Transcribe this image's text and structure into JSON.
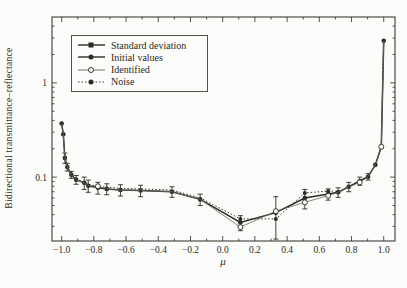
{
  "figure": {
    "background": "#fbfbf9",
    "ink": "#2d2a25"
  },
  "axes": {
    "xlabel": "μ",
    "ylabel": "Bidirectional transmittance–reflectance",
    "x_tick_labels": [
      "−1.0",
      "−0.8",
      "−0.6",
      "−0.4",
      "−0.2",
      "0.0",
      "0.2",
      "0.4",
      "0.6",
      "0.8",
      "1.0"
    ],
    "x_major_ticks": [
      -1.0,
      -0.8,
      -0.6,
      -0.4,
      -0.2,
      0.0,
      0.2,
      0.4,
      0.6,
      0.8,
      1.0
    ],
    "x_minor_ticks": [
      -0.9,
      -0.7,
      -0.5,
      -0.3,
      -0.1,
      0.1,
      0.3,
      0.5,
      0.7,
      0.9
    ],
    "y_tick_labels": [
      "1",
      "0.1"
    ],
    "y_major_ticks": [
      1,
      0.1
    ],
    "y_minor_ticks": [
      0.03,
      0.04,
      0.05,
      0.06,
      0.07,
      0.08,
      0.09,
      0.2,
      0.3,
      0.4,
      0.5,
      0.6,
      0.7,
      0.8,
      0.9,
      2,
      3,
      4
    ]
  },
  "legend": {
    "items": [
      {
        "label": "Standard deviation",
        "marker": "filled-square",
        "line": "solid"
      },
      {
        "label": "Initial values",
        "marker": "filled-circle",
        "line": "solid"
      },
      {
        "label": "Identified",
        "marker": "open-circle",
        "line": "thin"
      },
      {
        "label": "Noise",
        "marker": "filled-circle",
        "line": "dotted"
      }
    ]
  },
  "chart_data": {
    "type": "line",
    "title": "",
    "xlabel": "μ",
    "ylabel": "Bidirectional transmittance–reflectance",
    "yscale": "log",
    "xlim": [
      -1.06,
      1.07
    ],
    "ylim": [
      0.021,
      5.0
    ],
    "grid": false,
    "legend_position": "upper-left",
    "x": [
      -1.0,
      -0.99,
      -0.98,
      -0.965,
      -0.94,
      -0.91,
      -0.86,
      -0.835,
      -0.775,
      -0.72,
      -0.635,
      -0.51,
      -0.315,
      -0.14,
      0.11,
      0.33,
      0.51,
      0.655,
      0.717,
      0.783,
      0.851,
      0.903,
      0.948,
      0.985,
      1.0
    ],
    "series": [
      {
        "name": "Standard deviation",
        "role": "errorbars",
        "err": [
          0,
          0,
          0.02,
          0.012,
          0.009,
          0.01,
          0.013,
          0.012,
          0.011,
          0.01,
          0.01,
          0.01,
          0.009,
          0.008,
          0.006,
          0.02,
          0.014,
          0.009,
          0.008,
          0.009,
          0.009,
          0.008,
          0,
          0,
          0
        ]
      },
      {
        "name": "Initial values",
        "role": "line-filled",
        "values": [
          0.37,
          0.285,
          0.16,
          0.128,
          0.106,
          0.094,
          0.087,
          0.081,
          0.077,
          0.075,
          0.073,
          0.072,
          0.07,
          0.058,
          0.033,
          0.042,
          0.06,
          0.066,
          0.069,
          0.079,
          0.091,
          0.101,
          0.135,
          0.21,
          2.8
        ]
      },
      {
        "name": "Identified",
        "role": "line-open",
        "values": [
          0.37,
          0.285,
          0.16,
          0.128,
          0.106,
          0.094,
          0.087,
          0.081,
          0.08,
          0.075,
          0.073,
          0.072,
          0.07,
          0.058,
          0.0295,
          0.0435,
          0.054,
          0.0635,
          0.069,
          0.079,
          0.088,
          0.101,
          0.135,
          0.21,
          2.8
        ],
        "marker_indices": [
          8,
          14,
          15,
          16,
          17,
          20,
          23
        ]
      },
      {
        "name": "Noise",
        "role": "line-dotted",
        "values": [
          0.37,
          0.285,
          0.16,
          0.128,
          0.106,
          0.094,
          0.089,
          0.084,
          0.08,
          0.078,
          0.076,
          0.075,
          0.073,
          0.06,
          0.036,
          0.036,
          0.068,
          0.071,
          0.071,
          0.08,
          0.092,
          0.102,
          0.135,
          0.21,
          2.8
        ],
        "marker_indices": [
          14,
          15,
          16,
          17
        ]
      }
    ]
  }
}
